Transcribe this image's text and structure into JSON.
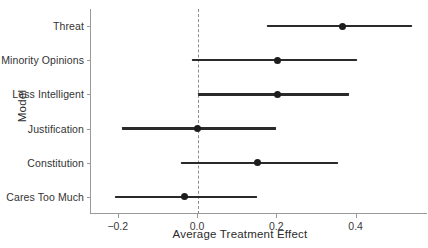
{
  "chart_data": {
    "type": "scatter",
    "title": "",
    "subtitle": "",
    "xlabel": "Average Treatment Effect",
    "ylabel": "Model",
    "orientation": "horizontal",
    "plot_style": "coefficient plot with 95% confidence intervals",
    "grid": false,
    "legend": null,
    "xlim": [
      -0.27,
      0.58
    ],
    "xticks": [
      -0.2,
      0.0,
      0.2,
      0.4
    ],
    "xtick_labels": [
      "-0.2",
      "0.0",
      "0.2",
      "0.4"
    ],
    "reference_line": {
      "value": 0.0,
      "style": "dashed",
      "color": "#8d8d8d"
    },
    "categories": [
      "Threat",
      "Minority Opinions",
      "Less Intelligent",
      "Justification",
      "Constitution",
      "Cares Too Much"
    ],
    "point_color": "#1d1d1d",
    "interval_color": "#2a2a2a",
    "points": [
      {
        "label": "Threat",
        "estimate": 0.365,
        "ci_low": 0.174,
        "ci_high": 0.54
      },
      {
        "label": "Minority Opinions",
        "estimate": 0.201,
        "ci_low": -0.015,
        "ci_high": 0.4
      },
      {
        "label": "Less Intelligent",
        "estimate": 0.201,
        "ci_low": 0.0,
        "ci_high": 0.382
      },
      {
        "label": "Justification",
        "estimate": -0.002,
        "ci_low": -0.191,
        "ci_high": 0.196
      },
      {
        "label": "Constitution",
        "estimate": 0.151,
        "ci_low": -0.043,
        "ci_high": 0.352
      },
      {
        "label": "Cares Too Much",
        "estimate": -0.033,
        "ci_low": -0.209,
        "ci_high": 0.148
      }
    ]
  }
}
